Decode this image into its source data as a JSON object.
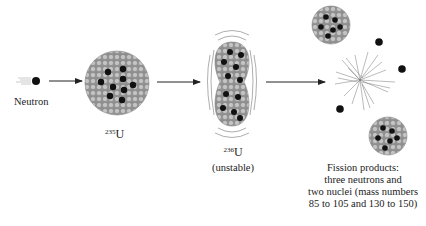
{
  "diagram": {
    "steps": [
      {
        "id": "neutron",
        "label": "Neutron"
      },
      {
        "id": "u235",
        "mass_number": "235",
        "symbol": "U"
      },
      {
        "id": "u236",
        "mass_number": "236",
        "symbol": "U",
        "note": "(unstable)"
      },
      {
        "id": "products",
        "lines": [
          "Fission products:",
          "three neutrons and",
          "two nuclei (mass numbers",
          "85 to 105 and 130 to 150)"
        ]
      }
    ],
    "colors": {
      "proton_neutron_fill": "#b5b5b5",
      "highlight_nucleon": "#111111",
      "arrow": "#222222"
    }
  }
}
